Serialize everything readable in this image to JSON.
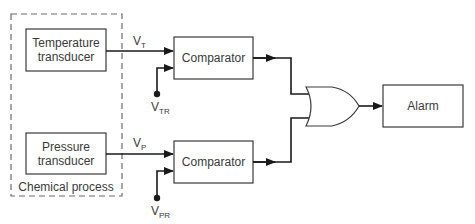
{
  "diagram": {
    "type": "block-diagram",
    "process_group": {
      "label": "Chemical process"
    },
    "blocks": {
      "temperature_transducer": {
        "line1": "Temperature",
        "line2": "transducer"
      },
      "pressure_transducer": {
        "line1": "Pressure",
        "line2": "transducer"
      },
      "comparator_1": {
        "label": "Comparator"
      },
      "comparator_2": {
        "label": "Comparator"
      },
      "or_gate": {
        "label": "OR"
      },
      "alarm": {
        "label": "Alarm"
      }
    },
    "signals": {
      "vt": {
        "main": "V",
        "sub": "T"
      },
      "vtr": {
        "main": "V",
        "sub": "TR"
      },
      "vp": {
        "main": "V",
        "sub": "P"
      },
      "vpr": {
        "main": "V",
        "sub": "PR"
      }
    },
    "colors": {
      "line": "#1a1a1a",
      "box_stroke": "#3a3a3a",
      "dashed": "#6a6a6a",
      "text": "#3a3a3a"
    }
  }
}
